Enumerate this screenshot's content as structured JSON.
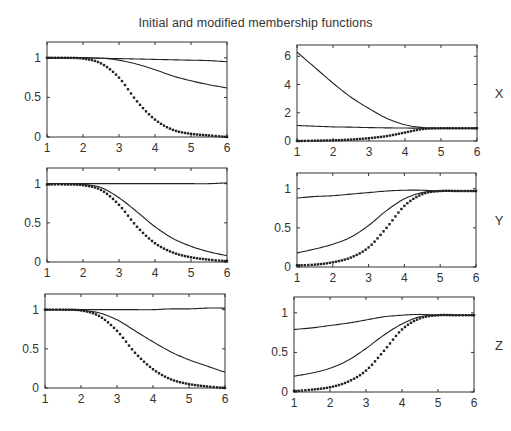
{
  "figure": {
    "title": "Initial and modified membership functions"
  },
  "chart_data": [
    {
      "id": "x-left",
      "type": "line",
      "row_label": "",
      "position": "top-left",
      "title": "",
      "xlabel": "",
      "ylabel": "",
      "xlim": [
        1,
        6
      ],
      "ylim": [
        0,
        1.2
      ],
      "xticks": [
        1,
        2,
        3,
        4,
        5,
        6
      ],
      "yticks": [
        0,
        0.5,
        1
      ],
      "ytick_labels": [
        "0",
        "0.5",
        "1"
      ],
      "grid": false,
      "x": [
        1,
        1.5,
        2,
        2.5,
        3,
        3.5,
        4,
        4.5,
        5,
        5.5,
        6
      ],
      "series": [
        {
          "name": "modified-1",
          "style": "solid",
          "values": [
            1,
            1,
            1,
            0.995,
            0.99,
            0.985,
            0.98,
            0.975,
            0.97,
            0.965,
            0.95
          ]
        },
        {
          "name": "modified-2",
          "style": "solid",
          "values": [
            1,
            1,
            1,
            0.995,
            0.97,
            0.92,
            0.85,
            0.77,
            0.71,
            0.66,
            0.62
          ]
        },
        {
          "name": "initial",
          "style": "dotted",
          "values": [
            1,
            1,
            0.99,
            0.93,
            0.75,
            0.45,
            0.22,
            0.09,
            0.04,
            0.02,
            0.0
          ]
        }
      ]
    },
    {
      "id": "x-right",
      "type": "line",
      "row_label": "X",
      "position": "top-right",
      "title": "",
      "xlabel": "",
      "ylabel": "",
      "xlim": [
        1,
        6
      ],
      "ylim": [
        0,
        6.8
      ],
      "xticks": [
        1,
        2,
        3,
        4,
        5,
        6
      ],
      "yticks": [
        0,
        2,
        4,
        6
      ],
      "ytick_labels": [
        "0",
        "2",
        "4",
        "6"
      ],
      "grid": false,
      "x": [
        1,
        1.5,
        2,
        2.5,
        3,
        3.5,
        4,
        4.5,
        5,
        5.5,
        6
      ],
      "series": [
        {
          "name": "modified-1",
          "style": "solid",
          "values": [
            6.3,
            5.2,
            4.1,
            3.1,
            2.3,
            1.6,
            1.15,
            0.95,
            0.9,
            0.9,
            0.9
          ]
        },
        {
          "name": "modified-2",
          "style": "solid",
          "values": [
            1.1,
            1.05,
            1.0,
            0.98,
            0.95,
            0.93,
            0.92,
            0.9,
            0.9,
            0.9,
            0.9
          ]
        },
        {
          "name": "initial",
          "style": "dotted",
          "values": [
            0.0,
            0.02,
            0.05,
            0.1,
            0.2,
            0.35,
            0.6,
            0.85,
            0.9,
            0.9,
            0.9
          ]
        }
      ]
    },
    {
      "id": "y-left",
      "type": "line",
      "row_label": "",
      "position": "middle-left",
      "title": "",
      "xlabel": "",
      "ylabel": "",
      "xlim": [
        1,
        6
      ],
      "ylim": [
        0,
        1.2
      ],
      "xticks": [
        1,
        2,
        3,
        4,
        5,
        6
      ],
      "yticks": [
        0,
        0.5,
        1
      ],
      "ytick_labels": [
        "0",
        "0.5",
        "1"
      ],
      "grid": false,
      "x": [
        1,
        1.5,
        2,
        2.5,
        3,
        3.5,
        4,
        4.5,
        5,
        5.5,
        6
      ],
      "series": [
        {
          "name": "modified-1",
          "style": "solid",
          "values": [
            1,
            1,
            1,
            1,
            1,
            1,
            1,
            1,
            1.0,
            1.0,
            1.01
          ]
        },
        {
          "name": "modified-2",
          "style": "solid",
          "values": [
            1,
            1,
            0.99,
            0.95,
            0.82,
            0.64,
            0.45,
            0.3,
            0.2,
            0.13,
            0.08
          ]
        },
        {
          "name": "initial",
          "style": "dotted",
          "values": [
            0.99,
            0.99,
            0.98,
            0.92,
            0.73,
            0.45,
            0.24,
            0.12,
            0.06,
            0.03,
            0.01
          ]
        }
      ]
    },
    {
      "id": "y-right",
      "type": "line",
      "row_label": "Y",
      "position": "middle-right",
      "title": "",
      "xlabel": "",
      "ylabel": "",
      "xlim": [
        1,
        6
      ],
      "ylim": [
        0,
        1.2
      ],
      "xticks": [
        1,
        2,
        3,
        4,
        5,
        6
      ],
      "yticks": [
        0,
        0.5,
        1
      ],
      "ytick_labels": [
        "0",
        "0.5",
        "1"
      ],
      "grid": false,
      "x": [
        1,
        1.5,
        2,
        2.5,
        3,
        3.5,
        4,
        4.5,
        5,
        5.5,
        6
      ],
      "series": [
        {
          "name": "modified-1",
          "style": "solid",
          "values": [
            0.88,
            0.9,
            0.91,
            0.93,
            0.95,
            0.97,
            0.98,
            0.98,
            0.97,
            0.97,
            0.97
          ]
        },
        {
          "name": "modified-2",
          "style": "solid",
          "values": [
            0.18,
            0.23,
            0.29,
            0.38,
            0.53,
            0.72,
            0.87,
            0.95,
            0.97,
            0.97,
            0.97
          ]
        },
        {
          "name": "initial",
          "style": "dotted",
          "values": [
            0.02,
            0.03,
            0.06,
            0.12,
            0.25,
            0.5,
            0.78,
            0.93,
            0.97,
            0.97,
            0.97
          ]
        }
      ]
    },
    {
      "id": "z-left",
      "type": "line",
      "row_label": "",
      "position": "bottom-left",
      "title": "",
      "xlabel": "",
      "ylabel": "",
      "xlim": [
        1,
        6
      ],
      "ylim": [
        0,
        1.2
      ],
      "xticks": [
        1,
        2,
        3,
        4,
        5,
        6
      ],
      "yticks": [
        0,
        0.5,
        1
      ],
      "ytick_labels": [
        "0",
        "0.5",
        "1"
      ],
      "grid": false,
      "x": [
        1,
        1.5,
        2,
        2.5,
        3,
        3.5,
        4,
        4.5,
        5,
        5.5,
        6
      ],
      "series": [
        {
          "name": "modified-1",
          "style": "solid",
          "values": [
            1,
            1,
            1,
            1,
            1,
            1,
            1,
            1.01,
            1.01,
            1.02,
            1.02
          ]
        },
        {
          "name": "modified-2",
          "style": "solid",
          "values": [
            1,
            1,
            0.99,
            0.96,
            0.87,
            0.73,
            0.59,
            0.46,
            0.36,
            0.28,
            0.2
          ]
        },
        {
          "name": "initial",
          "style": "dotted",
          "values": [
            1,
            1,
            0.99,
            0.92,
            0.73,
            0.45,
            0.24,
            0.11,
            0.05,
            0.02,
            0.0
          ]
        }
      ]
    },
    {
      "id": "z-right",
      "type": "line",
      "row_label": "Z",
      "position": "bottom-right",
      "title": "",
      "xlabel": "",
      "ylabel": "",
      "xlim": [
        1,
        6
      ],
      "ylim": [
        0,
        1.2
      ],
      "xticks": [
        1,
        2,
        3,
        4,
        5,
        6
      ],
      "yticks": [
        0,
        0.5,
        1
      ],
      "ytick_labels": [
        "0",
        "0.5",
        "1"
      ],
      "grid": false,
      "x": [
        1,
        1.5,
        2,
        2.5,
        3,
        3.5,
        4,
        4.5,
        5,
        5.5,
        6
      ],
      "series": [
        {
          "name": "modified-1",
          "style": "solid",
          "values": [
            0.79,
            0.81,
            0.84,
            0.87,
            0.91,
            0.95,
            0.97,
            0.98,
            0.97,
            0.97,
            0.97
          ]
        },
        {
          "name": "modified-2",
          "style": "solid",
          "values": [
            0.2,
            0.24,
            0.3,
            0.4,
            0.55,
            0.72,
            0.86,
            0.95,
            0.97,
            0.97,
            0.97
          ]
        },
        {
          "name": "initial",
          "style": "dotted",
          "values": [
            0.01,
            0.03,
            0.06,
            0.13,
            0.27,
            0.52,
            0.79,
            0.93,
            0.97,
            0.97,
            0.97
          ]
        }
      ]
    }
  ],
  "layout": {
    "panels": [
      {
        "left": 47,
        "top": 42,
        "right": 227,
        "bottom": 137
      },
      {
        "left": 297,
        "top": 45,
        "right": 477,
        "bottom": 141
      },
      {
        "left": 47,
        "top": 168,
        "right": 227,
        "bottom": 262
      },
      {
        "left": 297,
        "top": 173,
        "right": 476,
        "bottom": 267
      },
      {
        "left": 45,
        "top": 294,
        "right": 225,
        "bottom": 388
      },
      {
        "left": 294,
        "top": 297,
        "right": 474,
        "bottom": 392
      }
    ],
    "colors": {
      "line": "#222222",
      "axis": "#333333",
      "text": "#333333"
    }
  }
}
